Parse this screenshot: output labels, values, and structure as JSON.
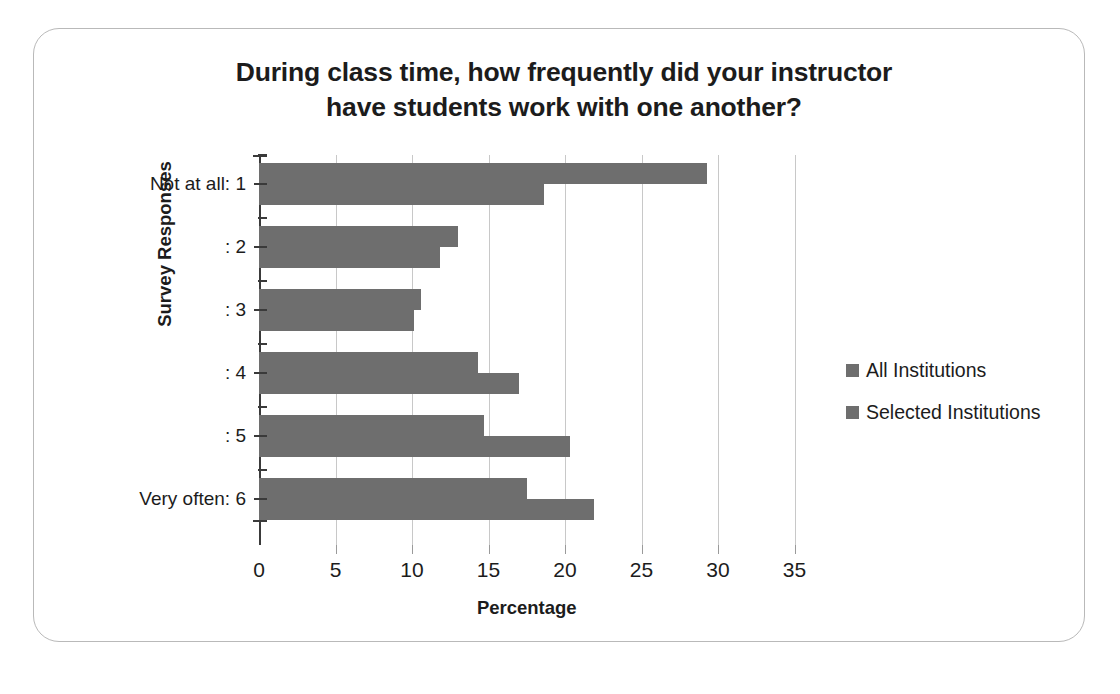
{
  "chart_data": {
    "type": "bar",
    "orientation": "horizontal",
    "title": "During class time, how frequently did your instructor have students work with one another?",
    "title_lines": [
      "During class time, how frequently did your instructor",
      "have students work with one another?"
    ],
    "xlabel": "Percentage",
    "ylabel": "Survey Responses",
    "categories": [
      "Not at all: 1",
      ": 2",
      ": 3",
      ": 4",
      ": 5",
      "Very often: 6"
    ],
    "series": [
      {
        "name": "All Institutions",
        "color": "#6e6e6e",
        "values": [
          29.3,
          13.0,
          10.6,
          14.3,
          14.7,
          17.5
        ]
      },
      {
        "name": "Selected Institutions",
        "color": "#6e6e6e",
        "values": [
          18.6,
          11.8,
          10.1,
          17.0,
          20.3,
          21.9
        ]
      }
    ],
    "xlim": [
      0,
      35
    ],
    "xticks": [
      0,
      5,
      10,
      15,
      20,
      25,
      30,
      35
    ],
    "xtick_labels": [
      "0",
      "5",
      "10",
      "15",
      "20",
      "25",
      "30",
      "35"
    ],
    "grid": "vertical",
    "legend_position": "right",
    "frame_color": "#b9b9b9",
    "gridline_color": "#c8c8c8",
    "axis_color": "#3a3a3a"
  }
}
